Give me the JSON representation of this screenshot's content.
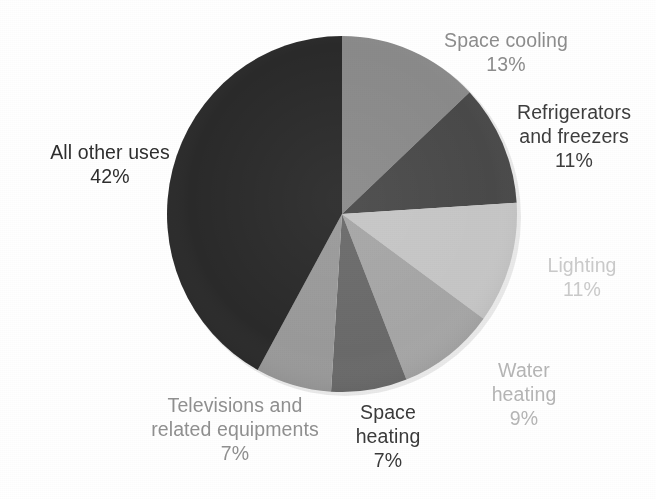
{
  "chart_data": {
    "type": "pie",
    "title": "",
    "subtitle": "",
    "xlabel": "",
    "ylabel": "",
    "legend_position": "none",
    "grid": false,
    "start_angle_deg": 0,
    "direction": "clockwise",
    "units": "percent",
    "categories": [
      "Space cooling",
      "Refrigerators and freezers",
      "Lighting",
      "Water heating",
      "Space heating",
      "Televisions and related equipments",
      "All other uses"
    ],
    "values": [
      13,
      11,
      11,
      9,
      7,
      7,
      42
    ],
    "slices": [
      {
        "label": "Space cooling",
        "label_line1": "Space cooling",
        "label_line2": "",
        "value": 13,
        "value_text": "13%",
        "color": "#8a8a8a",
        "label_color": "#8c8c8c"
      },
      {
        "label": "Refrigerators and freezers",
        "label_line1": "Refrigerators",
        "label_line2": "and freezers",
        "value": 11,
        "value_text": "11%",
        "color": "#4a4a4a",
        "label_color": "#3d3d3d"
      },
      {
        "label": "Lighting",
        "label_line1": "Lighting",
        "label_line2": "",
        "value": 11,
        "value_text": "11%",
        "color": "#c6c6c6",
        "label_color": "#c9c9c9"
      },
      {
        "label": "Water heating",
        "label_line1": "Water",
        "label_line2": "heating",
        "value": 9,
        "value_text": "9%",
        "color": "#a6a6a6",
        "label_color": "#b4b4b4"
      },
      {
        "label": "Space heating",
        "label_line1": "Space",
        "label_line2": "heating",
        "value": 7,
        "value_text": "7%",
        "color": "#6a6a6a",
        "label_color": "#3a3a3a"
      },
      {
        "label": "Televisions and related equipments",
        "label_line1": "Televisions and",
        "label_line2": "related equipments",
        "value": 7,
        "value_text": "7%",
        "color": "#9a9a9a",
        "label_color": "#8f8f8f"
      },
      {
        "label": "All other uses",
        "label_line1": "All other uses",
        "label_line2": "",
        "value": 42,
        "value_text": "42%",
        "color": "#2a2a2a",
        "label_color": "#2e2e2e"
      }
    ],
    "total": 100
  },
  "geometry": {
    "center_x": 342,
    "center_y": 214,
    "radius_x": 175,
    "radius_y": 178
  },
  "colors": {
    "background": "#ffffff",
    "slice_space_cooling": "#8a8a8a",
    "slice_refrigerators": "#4a4a4a",
    "slice_lighting": "#c6c6c6",
    "slice_water_heating": "#a6a6a6",
    "slice_space_heating": "#6a6a6a",
    "slice_televisions": "#9a9a9a",
    "slice_all_other": "#2a2a2a"
  }
}
